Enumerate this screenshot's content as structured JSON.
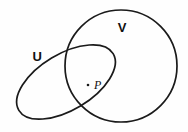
{
  "figure": {
    "title": "",
    "background_color": "#fefefe",
    "stroke_color": "#1a1a1a",
    "width": 188,
    "height": 132
  },
  "sets": [
    {
      "id": "set-u",
      "label": "U",
      "shape": "ellipse",
      "cx": 66,
      "cy": 82,
      "rx": 55,
      "ry": 28,
      "rotation_deg": -31,
      "stroke_width": 1.7,
      "label_x": 37,
      "label_y": 61
    },
    {
      "id": "set-v",
      "label": "V",
      "shape": "circle",
      "cx": 121,
      "cy": 66,
      "r": 56,
      "stroke_width": 1.7,
      "label_x": 122,
      "label_y": 32
    }
  ],
  "points": [
    {
      "id": "point-p",
      "label": "P",
      "dot_x": 88,
      "dot_y": 85,
      "dot_radius": 1.3,
      "label_x": 94,
      "label_y": 89
    }
  ]
}
